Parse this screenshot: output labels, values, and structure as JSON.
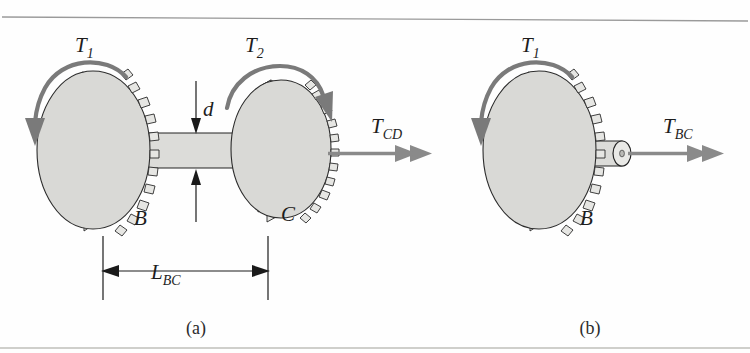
{
  "figure": {
    "background_color": "#fefefe",
    "gear_fill": "#d9d9d6",
    "shaft_fill": "#dcdcd9",
    "arrow_color": "#7a7a7a",
    "line_color": "#1a1a1a"
  },
  "panels": [
    {
      "id": "a",
      "caption": "(a)",
      "torque_labels": [
        {
          "base": "T",
          "sub": "1",
          "name": "torque-T1"
        },
        {
          "base": "T",
          "sub": "2",
          "name": "torque-T2"
        },
        {
          "base": "T",
          "sub": "CD",
          "name": "torque-TCD"
        }
      ],
      "point_labels": [
        {
          "text": "B",
          "name": "gear-label-B"
        },
        {
          "text": "C",
          "name": "gear-label-C"
        }
      ],
      "dimensions": [
        {
          "base": "d",
          "sub": "",
          "name": "diameter-d",
          "kind": "vertical"
        },
        {
          "base": "L",
          "sub": "BC",
          "name": "length-LBC",
          "kind": "horizontal"
        }
      ]
    },
    {
      "id": "b",
      "caption": "(b)",
      "torque_labels": [
        {
          "base": "T",
          "sub": "1",
          "name": "torque-T1"
        },
        {
          "base": "T",
          "sub": "BC",
          "name": "torque-TBC"
        }
      ],
      "point_labels": [
        {
          "text": "B",
          "name": "gear-label-B"
        }
      ],
      "dimensions": []
    }
  ],
  "labels": {
    "T1_a_base": "T",
    "T1_a_sub": "1",
    "T2_a_base": "T",
    "T2_a_sub": "2",
    "TCD_base": "T",
    "TCD_sub": "CD",
    "d_base": "d",
    "L_base": "L",
    "L_sub": "BC",
    "B_a": "B",
    "C_a": "C",
    "T1_b_base": "T",
    "T1_b_sub": "1",
    "TBC_base": "T",
    "TBC_sub": "BC",
    "B_b": "B",
    "caption_a": "(a)",
    "caption_b": "(b)"
  }
}
